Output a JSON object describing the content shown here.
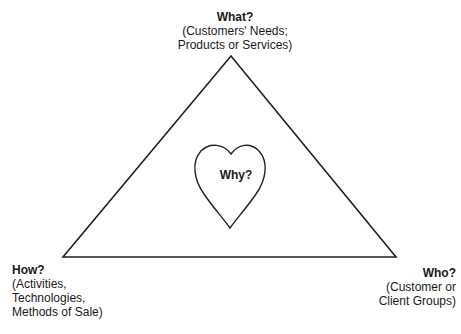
{
  "diagram": {
    "shape": "triangle-with-heart",
    "colors": {
      "stroke": "#222222",
      "background": "#ffffff",
      "text": "#1a1a1a"
    },
    "vertices": {
      "top": {
        "title": "What?",
        "lines": [
          "(Customers' Needs;",
          "Products or Services)"
        ]
      },
      "bottom_left": {
        "title": "How?",
        "lines": [
          "(Activities,",
          "Technologies,",
          "Methods of Sale)"
        ]
      },
      "bottom_right": {
        "title": "Who?",
        "lines": [
          "(Customer or",
          "Client Groups)"
        ]
      }
    },
    "center": {
      "title": "Why?",
      "icon": "heart-icon"
    }
  }
}
